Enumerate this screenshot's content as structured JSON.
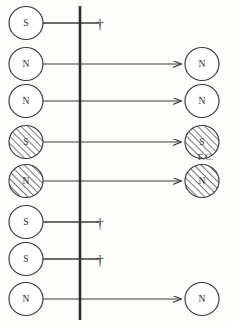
{
  "figure": {
    "width": 234,
    "height": 326,
    "background_color": "#fdfdfb",
    "ink_color": "#3a3a3a",
    "barrier": {
      "name": "vertical-barrier-line",
      "x": 80,
      "y_top": 6,
      "y_bottom": 320,
      "stroke_width": 2.6
    },
    "annotation": {
      "text": "F.C.",
      "x": 198,
      "y": 152
    },
    "dagger_glyph": "†",
    "left_circle_x": 26,
    "right_circle_x": 202,
    "circle_radius": 17,
    "dagger_x": 100
  },
  "chart_data": {
    "type": "diagram",
    "title": "",
    "rows": [
      {
        "y": 23,
        "left_label": "S",
        "left_hatched": false,
        "arrow": false,
        "dagger": true,
        "right_label": null,
        "right_hatched": false
      },
      {
        "y": 64,
        "left_label": "N",
        "left_hatched": false,
        "arrow": true,
        "dagger": false,
        "right_label": "N",
        "right_hatched": false
      },
      {
        "y": 101,
        "left_label": "N",
        "left_hatched": false,
        "arrow": true,
        "dagger": false,
        "right_label": "N",
        "right_hatched": false
      },
      {
        "y": 142,
        "left_label": "S",
        "left_hatched": true,
        "arrow": true,
        "dagger": false,
        "right_label": "S",
        "right_hatched": true
      },
      {
        "y": 181,
        "left_label": "N",
        "left_hatched": true,
        "arrow": true,
        "dagger": false,
        "right_label": "N",
        "right_hatched": true
      },
      {
        "y": 222,
        "left_label": "S",
        "left_hatched": false,
        "arrow": false,
        "dagger": true,
        "right_label": null,
        "right_hatched": false
      },
      {
        "y": 259,
        "left_label": "S",
        "left_hatched": false,
        "arrow": false,
        "dagger": true,
        "right_label": null,
        "right_hatched": false
      },
      {
        "y": 299,
        "left_label": "N",
        "left_hatched": false,
        "arrow": true,
        "dagger": false,
        "right_label": "N",
        "right_hatched": false
      }
    ]
  }
}
